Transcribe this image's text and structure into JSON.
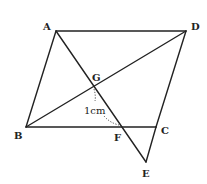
{
  "diagram": {
    "type": "geometry-figure",
    "points": {
      "A": {
        "label": "A",
        "x": 56,
        "y": 31
      },
      "D": {
        "label": "D",
        "x": 186,
        "y": 31
      },
      "B": {
        "label": "B",
        "x": 26,
        "y": 127
      },
      "C": {
        "label": "C",
        "x": 156,
        "y": 127
      },
      "G": {
        "label": "G",
        "x": 93,
        "y": 86
      },
      "F": {
        "label": "F",
        "x": 120,
        "y": 127
      },
      "E": {
        "label": "E",
        "x": 146,
        "y": 162
      }
    },
    "segments": [
      "AD",
      "AB",
      "DC",
      "BC",
      "BD",
      "AE",
      "CE"
    ],
    "measurement": {
      "label": "1cm",
      "between": [
        "G",
        "F"
      ]
    },
    "colors": {
      "stroke": "#222222",
      "background": "#ffffff"
    }
  }
}
